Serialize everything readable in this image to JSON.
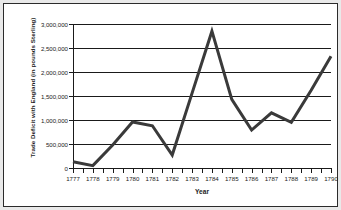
{
  "chart_data": {
    "type": "line",
    "title": "",
    "xlabel": "Year",
    "ylabel": "Trade Deficit with England (in pounds Sterling)",
    "x": [
      1777,
      1778,
      1779,
      1780,
      1781,
      1782,
      1783,
      1784,
      1785,
      1786,
      1787,
      1788,
      1789,
      1790
    ],
    "categories": [
      "1777",
      "1778",
      "1779",
      "1780",
      "1781",
      "1782",
      "1783",
      "1784",
      "1785",
      "1786",
      "1787",
      "1788",
      "1789",
      "1790"
    ],
    "values": [
      130000,
      50000,
      480000,
      960000,
      880000,
      270000,
      1560000,
      2850000,
      1430000,
      790000,
      1150000,
      950000,
      1620000,
      2330000
    ],
    "series": [
      {
        "name": "Trade Deficit with England",
        "values": [
          130000,
          50000,
          480000,
          960000,
          880000,
          270000,
          1560000,
          2850000,
          1430000,
          790000,
          1150000,
          950000,
          1620000,
          2330000
        ],
        "color": "#3a3a3a"
      }
    ],
    "ylim": [
      0,
      3000000
    ],
    "xlim": [
      1777,
      1790
    ],
    "yticks": [
      0,
      500000,
      1000000,
      1500000,
      2000000,
      2500000,
      3000000
    ],
    "ytick_labels": [
      "0",
      "500,000",
      "1,000,000",
      "1,500,000",
      "2,000,000",
      "2,500,000",
      "3,000,000"
    ],
    "grid": true,
    "grid_axis": "y",
    "legend": false,
    "legend_position": "none",
    "line_color": "#3a3a3a",
    "line_width": 3,
    "minor_xticks": true
  },
  "figure": {
    "background_color": "#ffffff",
    "outer_background_color": "#e9e9e9",
    "border_color": "#2b2b2b",
    "axis_color": "#1a1a1a"
  }
}
